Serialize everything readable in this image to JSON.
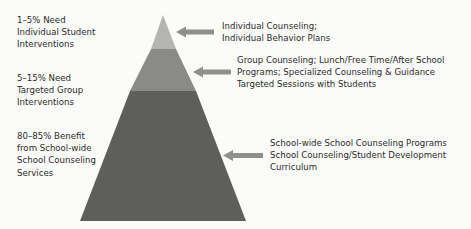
{
  "diagram": {
    "type": "tiered-pyramid",
    "colors": {
      "background": "#fbfbfa",
      "tier_top": "#b4b4b2",
      "tier_middle": "#8a8a88",
      "tier_bottom": "#5e5e5c",
      "arrow": "#8f8f8d",
      "text": "#2b2b2b"
    },
    "tiers": [
      {
        "level": "top",
        "left_label": [
          "1–5% Need",
          "Individual Student",
          "Interventions"
        ],
        "right_label": [
          "Individual Counseling;",
          "Individual Behavior Plans"
        ]
      },
      {
        "level": "middle",
        "left_label": [
          "5–15% Need",
          "Targeted Group",
          "Interventions"
        ],
        "right_label": [
          "Group Counseling; Lunch/Free Time/After School",
          "Programs; Specialized Counseling & Guidance",
          "Targeted Sessions with Students"
        ]
      },
      {
        "level": "bottom",
        "left_label": [
          "80–85% Benefit",
          "from School-wide",
          "School Counseling",
          "Services"
        ],
        "right_label": [
          "School-wide School Counseling Programs",
          "School Counseling/Student Development",
          "Curriculum"
        ]
      }
    ]
  }
}
